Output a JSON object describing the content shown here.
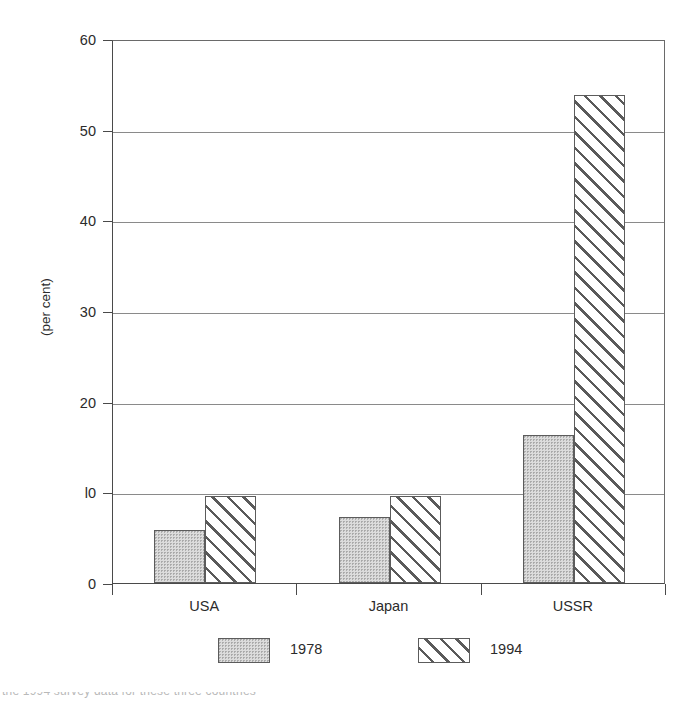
{
  "chart_data": {
    "type": "bar",
    "title": "",
    "subtitle": "",
    "xlabel": "",
    "ylabel": "(per cent)",
    "ylim": [
      0,
      60
    ],
    "ytick_values": [
      0,
      10,
      20,
      30,
      40,
      50,
      60
    ],
    "ytick_labels": [
      "0",
      "l0",
      "20",
      "30",
      "40",
      "50",
      "60"
    ],
    "grid": "horizontal",
    "legend_position": "bottom",
    "categories": [
      "USA",
      "Japan",
      "USSR"
    ],
    "series": [
      {
        "name": "1978",
        "fill": "dotted",
        "values": [
          5.8,
          7.3,
          16.3
        ]
      },
      {
        "name": "1994",
        "fill": "hatched",
        "values": [
          9.6,
          9.6,
          53.8
        ]
      }
    ],
    "colors": {
      "dotted_fill": "#dcdcdc",
      "dotted_dot": "#a8a8a8",
      "hatch_line": "#5a5a5a",
      "bar_border": "#5c5c5c",
      "axis": "#4a4a4a",
      "gridline": "#8a8a8a",
      "text": "#2b2b2b",
      "background": "#ffffff"
    }
  },
  "legend": {
    "entries": [
      {
        "label": "1978",
        "swatch": "dotted-swatch"
      },
      {
        "label": "1994",
        "swatch": "hatched-swatch"
      }
    ]
  },
  "caption_remnant": "the 1994 survey data for these three countries"
}
